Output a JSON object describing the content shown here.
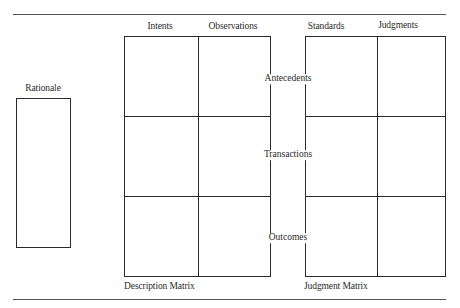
{
  "diagram": {
    "rationale": {
      "label": "Rationale"
    },
    "description_matrix": {
      "title": "Description Matrix",
      "columns": [
        "Intents",
        "Observations"
      ]
    },
    "judgment_matrix": {
      "title": "Judgment Matrix",
      "columns": [
        "Standards",
        "Judgments"
      ]
    },
    "rows": [
      "Antecedents",
      "Transactions",
      "Outcomes"
    ],
    "colors": {
      "line": "#2a2a2a",
      "rule": "#555555",
      "background": "#ffffff"
    }
  }
}
